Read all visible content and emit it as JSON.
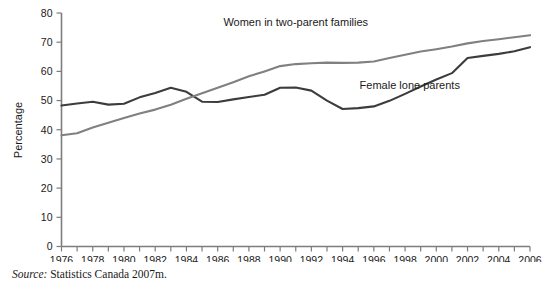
{
  "figure": {
    "y_axis_title": "Percentage",
    "source_prefix": "Source:",
    "source_text": " Statistics Canada 2007m."
  },
  "chart_data": {
    "type": "line",
    "title": "",
    "xlabel": "",
    "ylabel": "Percentage",
    "xlim": [
      1976,
      2006
    ],
    "ylim": [
      0,
      80
    ],
    "ytick_values": [
      0,
      10,
      20,
      30,
      40,
      50,
      60,
      70,
      80
    ],
    "ytick_labels": [
      "0",
      "10",
      "20",
      "30",
      "40",
      "50",
      "60",
      "70",
      "80"
    ],
    "xtick_values": [
      1976,
      1977,
      1978,
      1979,
      1980,
      1981,
      1982,
      1983,
      1984,
      1985,
      1986,
      1987,
      1988,
      1989,
      1990,
      1991,
      1992,
      1993,
      1994,
      1995,
      1996,
      1997,
      1998,
      1999,
      2000,
      2001,
      2002,
      2003,
      2004,
      2005,
      2006
    ],
    "xtick_labels": [
      "1976",
      "",
      "1978",
      "",
      "1980",
      "",
      "1982",
      "",
      "1984",
      "",
      "1986",
      "",
      "1988",
      "",
      "1990",
      "",
      "1992",
      "",
      "1994",
      "",
      "1996",
      "",
      "1998",
      "",
      "2000",
      "",
      "2002",
      "",
      "2004",
      "",
      "2006"
    ],
    "grid": false,
    "legend_position": "inline-annotations",
    "x": [
      1976,
      1977,
      1978,
      1979,
      1980,
      1981,
      1982,
      1983,
      1984,
      1985,
      1986,
      1987,
      1988,
      1989,
      1990,
      1991,
      1992,
      1993,
      1994,
      1995,
      1996,
      1997,
      1998,
      1999,
      2000,
      2001,
      2002,
      2003,
      2004,
      2005,
      2006
    ],
    "series": [
      {
        "name": "Female lone parents",
        "color": "#3c3c3c",
        "label_x": 1998.3,
        "label_y": 54.0,
        "values": [
          48.3,
          49.0,
          49.6,
          48.6,
          48.9,
          51.1,
          52.6,
          54.4,
          53.0,
          49.6,
          49.5,
          50.4,
          51.2,
          52.0,
          54.4,
          54.5,
          53.4,
          50.0,
          47.1,
          47.4,
          48.0,
          49.9,
          52.3,
          54.8,
          57.2,
          59.4,
          64.6,
          65.3,
          66.0,
          66.9,
          68.3
        ]
      },
      {
        "name": "Women in two-parent families",
        "color": "#808080",
        "label_x": 1991.0,
        "label_y": 75.5,
        "values": [
          38.1,
          38.8,
          40.8,
          42.4,
          44.0,
          45.6,
          46.9,
          48.6,
          50.6,
          52.5,
          54.4,
          56.3,
          58.3,
          60.0,
          61.8,
          62.5,
          62.8,
          63.0,
          62.9,
          63.0,
          63.4,
          64.6,
          65.7,
          66.8,
          67.6,
          68.5,
          69.6,
          70.4,
          71.0,
          71.7,
          72.4
        ]
      }
    ]
  }
}
